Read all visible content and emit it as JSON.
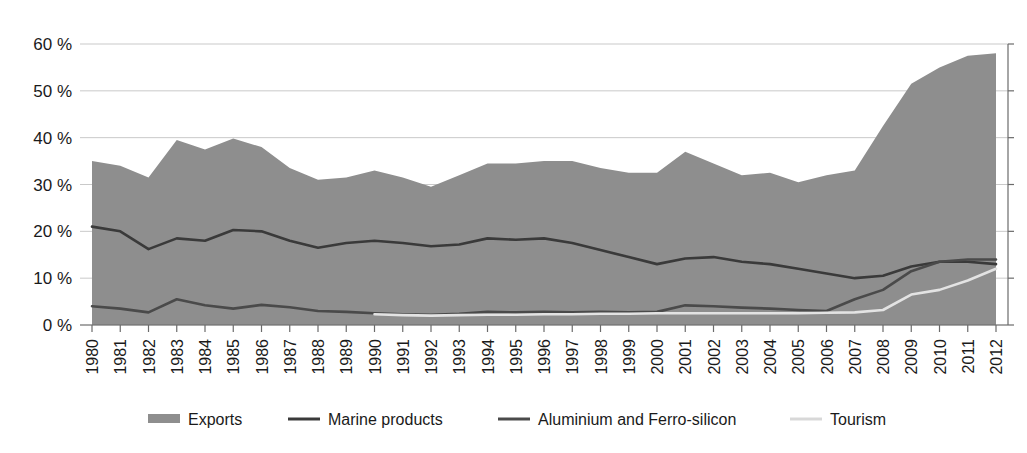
{
  "chart_data": {
    "type": "area",
    "title": "",
    "subtitle": "",
    "xlabel": "",
    "ylabel": "",
    "ylim": [
      0,
      62
    ],
    "yticks": [
      0,
      10,
      20,
      30,
      40,
      50,
      60
    ],
    "ytick_labels": [
      "0 %",
      "10 %",
      "20 %",
      "30 %",
      "40 %",
      "50 %",
      "60 %"
    ],
    "grid": true,
    "legend_position": "bottom",
    "x": [
      1980,
      1981,
      1982,
      1983,
      1984,
      1985,
      1986,
      1987,
      1988,
      1989,
      1990,
      1991,
      1992,
      1993,
      1994,
      1995,
      1996,
      1997,
      1998,
      1999,
      2000,
      2001,
      2002,
      2003,
      2004,
      2005,
      2006,
      2007,
      2008,
      2009,
      2010,
      2011,
      2012
    ],
    "xtick_labels": [
      "1980",
      "1981",
      "1982",
      "1983",
      "1984",
      "1985",
      "1986",
      "1987",
      "1988",
      "1989",
      "1990",
      "1991",
      "1992",
      "1993",
      "1994",
      "1995",
      "1996",
      "1997",
      "1998",
      "1999",
      "2000",
      "2001",
      "2002",
      "2003",
      "2004",
      "2005",
      "2006",
      "2007",
      "2008",
      "2009",
      "2010",
      "2011",
      "2012"
    ],
    "series": [
      {
        "name": "Exports",
        "kind": "area",
        "color": "#8e8e8e",
        "values": [
          35.0,
          34.0,
          31.5,
          39.5,
          37.5,
          39.8,
          38.0,
          33.5,
          31.0,
          31.5,
          33.0,
          31.5,
          29.5,
          32.0,
          34.5,
          34.5,
          35.0,
          35.0,
          33.5,
          32.5,
          32.5,
          37.0,
          34.5,
          32.0,
          32.5,
          30.5,
          32.0,
          33.0,
          42.5,
          51.5,
          55.0,
          57.5,
          58.0
        ]
      },
      {
        "name": "Marine products",
        "kind": "line",
        "color": "#3a3a3a",
        "values": [
          21.0,
          20.0,
          16.2,
          18.5,
          18.0,
          20.3,
          20.0,
          18.0,
          16.5,
          17.5,
          18.0,
          17.5,
          16.8,
          17.2,
          18.5,
          18.2,
          18.5,
          17.5,
          16.0,
          14.5,
          13.0,
          14.2,
          14.5,
          13.5,
          13.0,
          12.0,
          11.0,
          10.0,
          10.5,
          12.5,
          13.5,
          13.5,
          13.0
        ]
      },
      {
        "name": "Aluminium and Ferro-silicon",
        "kind": "line",
        "color": "#4a4a4a",
        "values": [
          4.0,
          3.5,
          2.7,
          5.5,
          4.2,
          3.5,
          4.3,
          3.8,
          3.0,
          2.8,
          2.5,
          2.3,
          2.2,
          2.4,
          2.8,
          2.7,
          2.8,
          2.7,
          2.8,
          2.7,
          2.8,
          4.2,
          4.0,
          3.7,
          3.5,
          3.2,
          3.0,
          5.5,
          7.5,
          11.5,
          13.5,
          14.0,
          14.0
        ]
      },
      {
        "name": "Tourism",
        "kind": "line",
        "color": "#e3e3e3",
        "values": [
          null,
          null,
          null,
          null,
          null,
          null,
          null,
          null,
          null,
          null,
          2.3,
          2.1,
          2.0,
          2.1,
          2.2,
          2.2,
          2.3,
          2.3,
          2.4,
          2.4,
          2.5,
          2.5,
          2.5,
          2.5,
          2.5,
          2.5,
          2.6,
          2.7,
          3.2,
          6.5,
          7.5,
          9.5,
          12.0
        ]
      }
    ]
  },
  "legend": {
    "items": [
      {
        "label": "Exports",
        "swatch": "bar",
        "color": "#8e8e8e"
      },
      {
        "label": "Marine products",
        "swatch": "line",
        "color": "#3a3a3a"
      },
      {
        "label": "Aluminium and Ferro-silicon",
        "swatch": "line",
        "color": "#4a4a4a"
      },
      {
        "label": "Tourism",
        "swatch": "line",
        "color": "#d8d8d8"
      }
    ]
  }
}
